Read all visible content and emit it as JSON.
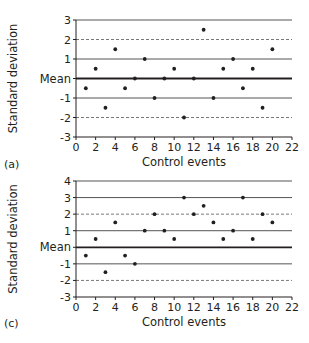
{
  "chart_data": [
    {
      "type": "scatter",
      "panel_label": "(a)",
      "xlabel": "Control events",
      "ylabel": "Standard deviation",
      "xlim": [
        0,
        22
      ],
      "ylim": [
        -3,
        3
      ],
      "x_ticks": [
        "0",
        "2",
        "4",
        "6",
        "8",
        "10",
        "12",
        "14",
        "16",
        "18",
        "20",
        "22"
      ],
      "y_ticks": [
        "3",
        "2",
        "1",
        "Mean",
        "-1",
        "-2",
        "-3"
      ],
      "y_tick_values": [
        3,
        2,
        1,
        0,
        -1,
        -2,
        -3
      ],
      "reference_lines": [
        {
          "y": 3,
          "style": "solid"
        },
        {
          "y": 2,
          "style": "dashed"
        },
        {
          "y": 1,
          "style": "solid"
        },
        {
          "y": 0,
          "style": "solid-thick",
          "label": "Mean"
        },
        {
          "y": -1,
          "style": "solid"
        },
        {
          "y": -2,
          "style": "dashed"
        }
      ],
      "x": [
        1,
        2,
        3,
        4,
        5,
        6,
        7,
        8,
        9,
        10,
        11,
        12,
        13,
        14,
        15,
        16,
        17,
        18,
        19,
        20
      ],
      "y": [
        -0.5,
        0.5,
        -1.5,
        1.5,
        -0.5,
        0,
        1,
        -1,
        0,
        0.5,
        -2,
        0,
        2.5,
        -1,
        0.5,
        1,
        -0.5,
        0.5,
        -1.5,
        1.5
      ],
      "grid": false
    },
    {
      "type": "scatter",
      "panel_label": "(c)",
      "xlabel": "Control events",
      "ylabel": "Standard deviation",
      "xlim": [
        0,
        22
      ],
      "ylim": [
        -3,
        4
      ],
      "x_ticks": [
        "0",
        "2",
        "4",
        "6",
        "8",
        "10",
        "12",
        "14",
        "16",
        "18",
        "20",
        "22"
      ],
      "y_ticks": [
        "4",
        "3",
        "2",
        "1",
        "Mean",
        "-1",
        "-2",
        "-3"
      ],
      "y_tick_values": [
        4,
        3,
        2,
        1,
        0,
        -1,
        -2,
        -3
      ],
      "reference_lines": [
        {
          "y": 4,
          "style": "solid"
        },
        {
          "y": 3,
          "style": "solid"
        },
        {
          "y": 2,
          "style": "dashed"
        },
        {
          "y": 1,
          "style": "solid"
        },
        {
          "y": 0,
          "style": "solid-thick",
          "label": "Mean"
        },
        {
          "y": -1,
          "style": "solid"
        },
        {
          "y": -2,
          "style": "dashed"
        }
      ],
      "x": [
        1,
        2,
        3,
        4,
        5,
        6,
        7,
        8,
        9,
        10,
        11,
        12,
        13,
        14,
        15,
        16,
        17,
        18,
        19,
        20
      ],
      "y": [
        -0.5,
        0.5,
        -1.5,
        1.5,
        -0.5,
        -1,
        1,
        2,
        1,
        0.5,
        3,
        2,
        2.5,
        1.5,
        0.5,
        1,
        3,
        0.5,
        2,
        1.5
      ],
      "grid": false
    }
  ],
  "colors": {
    "ink": "#231f20",
    "line": "#3a3a3a"
  }
}
